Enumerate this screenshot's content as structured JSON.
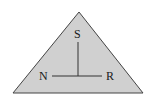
{
  "diagram": {
    "shape": "triangle",
    "fill_color": "#d0d0d0",
    "stroke_color": "#444444",
    "labels": {
      "top": "S",
      "left": "N",
      "right": "R"
    }
  }
}
